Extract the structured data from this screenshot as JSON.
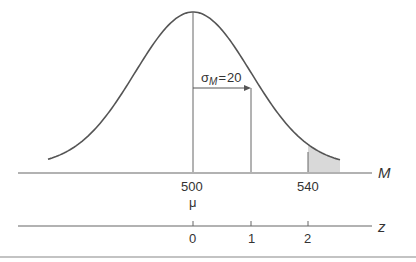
{
  "figure": {
    "type": "normal-distribution-diagram",
    "colors": {
      "line": "#555555",
      "shade": "#d9d9d9",
      "text": "#333333"
    },
    "curve": {
      "mean_x": 193,
      "sd_px": 58,
      "peak_y": 12,
      "base_y": 172
    },
    "sigma_label": {
      "symbol": "σ",
      "subscript": "M",
      "equals": "=",
      "value": "20"
    },
    "m_axis": {
      "label": "M",
      "ticks": [
        {
          "value": "500",
          "sub": "μ"
        },
        {
          "value": "540"
        }
      ]
    },
    "z_axis": {
      "label": "z",
      "ticks": [
        "0",
        "1",
        "2"
      ]
    },
    "shaded_region": "M > 540 (z > 2)"
  },
  "chart_data": {
    "type": "area",
    "title": "",
    "distribution": "normal",
    "mean": 500,
    "std_error": 20,
    "annotation": "σM = 20",
    "x_axis_M": {
      "label": "M",
      "ticks": [
        500,
        540
      ],
      "mu_at": 500
    },
    "x_axis_z": {
      "label": "z",
      "ticks": [
        0,
        1,
        2
      ]
    },
    "shaded": {
      "from_M": 540,
      "from_z": 2,
      "tail": "right"
    },
    "grid": false
  }
}
